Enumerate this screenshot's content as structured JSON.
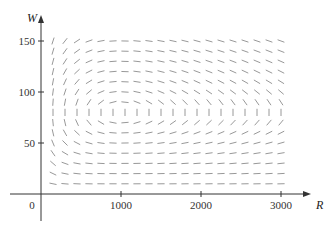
{
  "chart_data": {
    "type": "direction-field",
    "title": "",
    "xlabel": "R",
    "ylabel": "W",
    "xlim": [
      0,
      3100
    ],
    "ylim": [
      0,
      160
    ],
    "x_ticks": [
      1000,
      2000,
      3000
    ],
    "x_tick_labels": [
      "1000",
      "2000",
      "3000"
    ],
    "y_ticks": [
      50,
      100,
      150
    ],
    "y_tick_labels": [
      "50",
      "100",
      "150"
    ],
    "origin_label": "0",
    "grid": false,
    "legend": null,
    "field": {
      "description": "Predator-prey slope field dW/dR",
      "dR_dt": "0.08*R - 0.001*R*W",
      "dW_dt": "-0.02*W + 0.00002*R*W",
      "equilibrium": [
        1000,
        80
      ],
      "sample_R_start": 150,
      "sample_R_step": 150,
      "sample_R_count": 20,
      "sample_W_start": 10,
      "sample_W_step": 10,
      "sample_W_count": 15
    },
    "colors": {
      "axis": "#333333",
      "segments": "#8c8c8c"
    }
  }
}
